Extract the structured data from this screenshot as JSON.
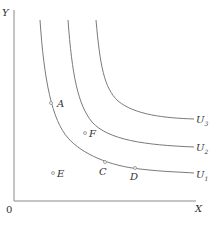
{
  "diagram": {
    "type": "indifference-curves",
    "colors": {
      "line": "#7a7a7a",
      "text": "#333333",
      "point": "#8a8a8a"
    },
    "axes": {
      "y_label": "Y",
      "x_label": "X",
      "origin_label": "0"
    },
    "curves": [
      {
        "id": "U1",
        "label_main": "U",
        "label_sub": "1"
      },
      {
        "id": "U2",
        "label_main": "U",
        "label_sub": "2"
      },
      {
        "id": "U3",
        "label_main": "U",
        "label_sub": "3"
      }
    ],
    "points": [
      {
        "id": "A",
        "label": "A",
        "on_curve": "U1"
      },
      {
        "id": "C",
        "label": "C",
        "on_curve": "U1"
      },
      {
        "id": "D",
        "label": "D",
        "on_curve": "U1"
      },
      {
        "id": "F",
        "label": "F",
        "between": "U1-U2"
      },
      {
        "id": "E",
        "label": "E",
        "below": "U1"
      }
    ]
  }
}
